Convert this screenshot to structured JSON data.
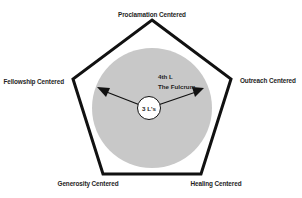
{
  "diagram": {
    "type": "pentagon-hub",
    "colors": {
      "background": "#ffffff",
      "pentagon_stroke": "#111111",
      "circle_fill": "#c8c8c8",
      "hub_fill": "#ffffff",
      "arrow": "#111111",
      "text": "#1e1e1e"
    },
    "vertices": {
      "top": "Proclamation Centered",
      "right": "Outreach Centered",
      "bottom_right": "Healing Centered",
      "bottom_left": "Generosity Centered",
      "left": "Fellowship Centered"
    },
    "hub": {
      "label": "3 L's"
    },
    "annotation": {
      "line1": "4th L",
      "line2": "The Fulcrum"
    },
    "arrows": [
      {
        "direction": "upper-left"
      },
      {
        "direction": "upper-right"
      }
    ]
  }
}
